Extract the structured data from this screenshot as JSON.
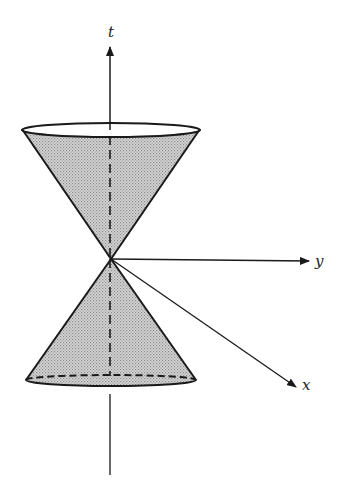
{
  "diagram": {
    "axes": {
      "t": {
        "label": "t",
        "label_pos": [
          110,
          36
        ]
      },
      "y": {
        "label": "y",
        "label_pos": [
          319,
          265
        ]
      },
      "x": {
        "label": "x",
        "label_pos": [
          304,
          389
        ]
      }
    },
    "apex": [
      111,
      259
    ],
    "upper_cone": {
      "cx": 111,
      "cy": 130,
      "rx": 89,
      "ry": 7,
      "fill": "#cfcfcf"
    },
    "lower_cone": {
      "cx": 111,
      "cy": 380,
      "rx": 85,
      "ry": 6,
      "fill": "#cfcfcf"
    },
    "colors": {
      "stroke": "#1a1a1a",
      "shade": "#cfcfcf",
      "background": "#ffffff"
    }
  }
}
